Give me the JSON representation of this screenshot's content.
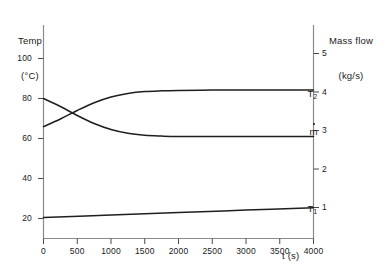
{
  "chart_data": {
    "type": "line",
    "title": "",
    "xlabel": "t (s)",
    "ylabel_left": "Temp\n(°C)",
    "ylabel_right": "Mass flow\n(kg/s)",
    "xlim": [
      0,
      4000
    ],
    "ylim_left": [
      0,
      110
    ],
    "ylim_right": [
      0,
      5.5
    ],
    "grid": false,
    "legend": "inline-right",
    "xticks": [
      0,
      500,
      1000,
      1500,
      2000,
      2500,
      3000,
      3500,
      4000
    ],
    "xtick_labels": [
      "0",
      "500",
      "1000",
      "1500",
      "2000",
      "2500",
      "3000",
      "3500",
      "4000"
    ],
    "yticks_left": [
      20,
      40,
      60,
      80,
      100
    ],
    "ytick_labels_left": [
      "20",
      "40",
      "60",
      "80",
      "100"
    ],
    "yticks_right": [
      1,
      2,
      3,
      4,
      5
    ],
    "ytick_labels_right": [
      "1",
      "2",
      "3",
      "4",
      "5"
    ],
    "series": [
      {
        "name": "T2",
        "label": "T",
        "sub": "2",
        "axis": "left",
        "units": "°C",
        "x": [
          0,
          250,
          500,
          750,
          1000,
          1250,
          1500,
          1750,
          2000,
          2500,
          3000,
          3500,
          4000
        ],
        "values": [
          80.0,
          76.0,
          71.5,
          67.5,
          64.5,
          62.6,
          61.6,
          61.2,
          61.0,
          61.0,
          61.0,
          61.0,
          61.0
        ]
      },
      {
        "name": "mdot",
        "label": "ṁ",
        "sub": "",
        "axis": "right",
        "units": "kg/s",
        "x": [
          0,
          250,
          500,
          750,
          1000,
          1250,
          1500,
          1750,
          2000,
          2500,
          3000,
          3500,
          4000
        ],
        "values": [
          3.1,
          3.3,
          3.52,
          3.72,
          3.87,
          3.96,
          4.01,
          4.03,
          4.04,
          4.05,
          4.05,
          4.05,
          4.05
        ]
      },
      {
        "name": "T1",
        "label": "T",
        "sub": "1",
        "axis": "left",
        "units": "°C",
        "x": [
          0,
          1000,
          2000,
          3000,
          4000
        ],
        "values": [
          20.5,
          21.7,
          23.0,
          24.2,
          25.4
        ]
      }
    ],
    "annotations": [
      {
        "text": "T",
        "sub": "2",
        "x": 3700,
        "y_left": 85
      },
      {
        "text": "ṁ",
        "sub": "",
        "x": 3720,
        "y_left": 66
      },
      {
        "text": "T",
        "sub": "1",
        "x": 3700,
        "y_left": 29
      }
    ],
    "colors": {
      "axis": "#808080",
      "curve": "#1f1f1f",
      "text": "#1a1a1a",
      "background": "#ffffff"
    }
  },
  "labels": {
    "left_axis_line1": "Temp",
    "left_axis_line2": "(°C)",
    "right_axis_line1": "Mass flow",
    "right_axis_line2": "(kg/s)",
    "x_axis_title": "t (s)",
    "curve_t2": "T",
    "curve_t2_sub": "2",
    "curve_mdot": "m",
    "curve_t1": "T",
    "curve_t1_sub": "1",
    "ytick_l_0": "100",
    "ytick_l_1": "80",
    "ytick_l_2": "60",
    "ytick_l_3": "40",
    "ytick_l_4": "20",
    "ytick_r_0": "5",
    "ytick_r_1": "4",
    "ytick_r_2": "3",
    "ytick_r_3": "2",
    "ytick_r_4": "1",
    "xtick_0": "0",
    "xtick_1": "500",
    "xtick_2": "1000",
    "xtick_3": "1500",
    "xtick_4": "2000",
    "xtick_5": "2500",
    "xtick_6": "3000",
    "xtick_7": "3500",
    "xtick_8": "4000"
  }
}
